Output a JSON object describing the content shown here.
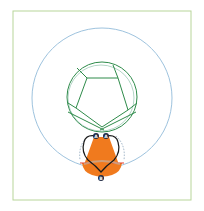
{
  "diagram": {
    "frame": {
      "x": 13,
      "y": 11,
      "w": 178,
      "h": 189,
      "stroke": "#b8d59a"
    },
    "outer_circle": {
      "cx": 102,
      "cy": 98,
      "r": 70,
      "stroke": "#9ec3de"
    },
    "inner_circle": {
      "cx": 102,
      "cy": 97,
      "r": 35,
      "stroke": "#2e8b4a"
    },
    "orange_shape": {
      "fill": "#f07a1e"
    },
    "colors": {
      "green": "#2e8b4a",
      "blue": "#9ec3de",
      "orange": "#f07a1e",
      "outline": "#1a1a1a",
      "red": "#e03a2a",
      "node": "#1f2a44"
    },
    "nodes": [
      {
        "id": "node-a-left",
        "label": "A",
        "x": 96,
        "y": 136
      },
      {
        "id": "node-a-right",
        "label": "A",
        "x": 106,
        "y": 136
      },
      {
        "id": "node-b",
        "label": "B",
        "x": 101,
        "y": 178
      }
    ]
  }
}
